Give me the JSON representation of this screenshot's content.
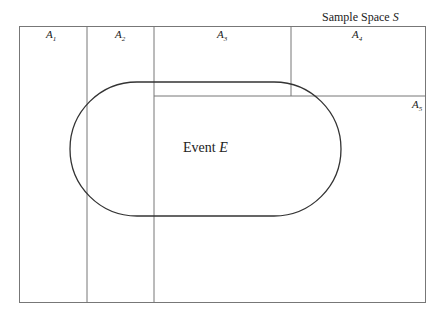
{
  "title": {
    "text": "Sample Space ",
    "symbol": "S"
  },
  "event": {
    "text": "Event ",
    "symbol": "E"
  },
  "partitions": [
    {
      "letter": "A",
      "index": "1"
    },
    {
      "letter": "A",
      "index": "2"
    },
    {
      "letter": "A",
      "index": "3"
    },
    {
      "letter": "A",
      "index": "4"
    },
    {
      "letter": "A",
      "index": "5"
    }
  ]
}
